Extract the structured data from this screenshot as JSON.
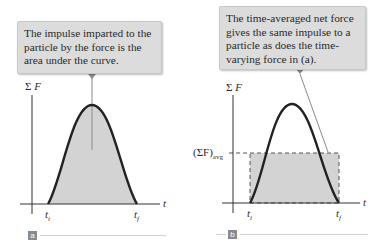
{
  "panel_a": {
    "tag": "a",
    "callout": "The impulse imparted to the particle by the force is the area under the curve.",
    "y_axis_label_sigma": "Σ",
    "y_axis_label_var": "F",
    "x_axis_label": "t",
    "ti_label": "t",
    "ti_sub": "i",
    "tf_label": "t",
    "tf_sub": "f"
  },
  "panel_b": {
    "tag": "b",
    "callout": "The time-averaged net force gives the same impulse to a particle as does the time-varying force in (a).",
    "y_axis_label_sigma": "Σ",
    "y_axis_label_var": "F",
    "avg_label_main": "(ΣF)",
    "avg_label_sub": "avg",
    "x_axis_label": "t",
    "ti_label": "t",
    "ti_sub": "i",
    "tf_label": "t",
    "tf_sub": "f"
  },
  "colors": {
    "curve": "#222222",
    "fill": "#d3d3d3",
    "callout_bg": "#dcdcdc",
    "pointer": "#8a8a8a",
    "axis": "#333333"
  }
}
